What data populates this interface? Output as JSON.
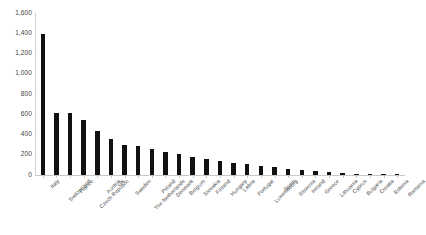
{
  "chart_data": {
    "type": "bar",
    "title": "",
    "subtitle": "",
    "xlabel": "",
    "ylabel": "",
    "ylim": [
      0,
      1600
    ],
    "ytick_step": 200,
    "ytick_labels": [
      "1,600",
      "1,400",
      "1,200",
      "1,000",
      "800",
      "600",
      "400",
      "200",
      "0"
    ],
    "ytick_values": [
      1600,
      1400,
      1200,
      1000,
      800,
      600,
      400,
      200,
      0
    ],
    "grid": false,
    "legend": false,
    "legend_position": "none",
    "bar_color": "#111111",
    "axis_color": "#c8c8c8",
    "background_color": "#ffffff",
    "label_color": "#4a4a4a",
    "categories": [
      "Italy",
      "Switzerland",
      "France",
      "Czech Republic",
      "Austria",
      "UK",
      "Sweden",
      "The Netherlands",
      "Poland",
      "Denmark",
      "Belgium",
      "Slovakia",
      "Finland",
      "Hungary",
      "Latvia",
      "Portugal",
      "Luxembourg",
      "Spain",
      "Slovenia",
      "Ireland",
      "Greece",
      "Lithuania",
      "Cyprus",
      "Bulgaria",
      "Croatia",
      "Estonia",
      "Romania"
    ],
    "values": [
      1395,
      610,
      608,
      548,
      432,
      355,
      300,
      285,
      258,
      228,
      205,
      180,
      160,
      140,
      120,
      105,
      92,
      78,
      62,
      48,
      36,
      28,
      20,
      14,
      9,
      5,
      3
    ]
  }
}
